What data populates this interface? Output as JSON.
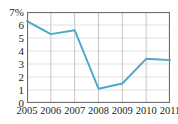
{
  "chart_data": {
    "type": "line",
    "title": "",
    "subtitle": "",
    "xlabel": "",
    "ylabel": "",
    "categories": [
      "2005",
      "2006",
      "2007",
      "2008",
      "2009",
      "2010",
      "2011"
    ],
    "x": [
      2005,
      2006,
      2007,
      2008,
      2009,
      2010,
      2011
    ],
    "series": [
      {
        "name": "",
        "values": [
          6.3,
          5.3,
          5.6,
          1.1,
          1.5,
          3.4,
          3.3
        ],
        "color": "#49a8cc"
      }
    ],
    "ylim": [
      0,
      7
    ],
    "xlim": [
      2005,
      2011
    ],
    "yticks": [
      0,
      1,
      2,
      3,
      4,
      5,
      6,
      7
    ],
    "ytick_labels": [
      "0",
      "1",
      "2",
      "3",
      "4",
      "5",
      "6",
      "7%"
    ],
    "xtick_labels": [
      "2005",
      "2006",
      "2007",
      "2008",
      "2009",
      "2010",
      "2011"
    ],
    "grid": true,
    "grid_horizontal": true,
    "grid_vertical": true,
    "legend": false,
    "legend_position": "none",
    "annotations": [],
    "units": "percent",
    "colors": {
      "series_line": "#49a8cc",
      "grid_horizontal": "#d9d9d9",
      "grid_vertical": "#b9b9b9",
      "plot_border": "#6d6e71",
      "tick_label": "#231f20",
      "background": "#ffffff"
    }
  }
}
